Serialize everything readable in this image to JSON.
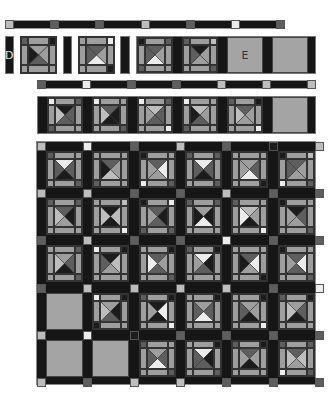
{
  "palette": {
    "w": "#ececec",
    "l": "#bdbdbd",
    "m": "#9e9e9e",
    "d": "#5e5e5e",
    "k": "#1c1c1c"
  },
  "labels": {
    "d": "D",
    "e": "E"
  },
  "top_bar": {
    "nodes": [
      "l",
      "d",
      "d",
      "l",
      "d",
      "w",
      "d"
    ]
  },
  "row2": {
    "tiles": [
      {
        "t": "m",
        "r": "m",
        "b": "d",
        "l": "k",
        "tl": "d",
        "tr": "k",
        "br": "m",
        "bl": "m"
      },
      {
        "t": "d",
        "r": "m",
        "b": "w",
        "l": "d",
        "tl": "m",
        "tr": "w",
        "br": "k",
        "bl": "m"
      },
      {
        "t": "d",
        "r": "m",
        "b": "w",
        "l": "d",
        "tl": "k",
        "tr": "d",
        "br": "m",
        "bl": "d"
      },
      {
        "t": "k",
        "r": "m",
        "b": "m",
        "l": "d",
        "tl": "d",
        "tr": "l",
        "br": "d",
        "bl": "m"
      }
    ]
  },
  "row3_bar": {
    "nodes": [
      "d",
      "w",
      "d",
      "d",
      "l",
      "l",
      "l"
    ]
  },
  "row4": {
    "tiles": [
      {
        "t": "k",
        "r": "d",
        "b": "d",
        "l": "l",
        "tl": "w",
        "tr": "d",
        "br": "m",
        "bl": "d"
      },
      {
        "t": "d",
        "r": "k",
        "b": "k",
        "l": "l",
        "tl": "w",
        "tr": "m",
        "br": "d",
        "bl": "m"
      },
      {
        "t": "l",
        "r": "d",
        "b": "d",
        "l": "m",
        "tl": "w",
        "tr": "d",
        "br": "w",
        "bl": "m"
      },
      {
        "t": "l",
        "r": "m",
        "b": "d",
        "l": "k",
        "tl": "w",
        "tr": "m",
        "br": "m",
        "bl": "d"
      },
      {
        "t": "d",
        "r": "m",
        "b": "m",
        "l": "l",
        "tl": "d",
        "tr": "k",
        "br": "w",
        "bl": "m"
      }
    ]
  },
  "grid": {
    "cols": 6,
    "rows": 5,
    "h_nodes": [
      [
        "l",
        "w",
        "d",
        "l",
        "d",
        "k",
        "l"
      ],
      [
        "l",
        "l",
        "d",
        "d",
        "l",
        "d",
        "d"
      ],
      [
        "d",
        "l",
        "d",
        "d",
        "w",
        "d",
        "d"
      ],
      [
        "d",
        "l",
        "l",
        "l",
        "l",
        "d",
        "w"
      ],
      [
        "l",
        "w",
        "k",
        "d",
        "d",
        "d",
        "d"
      ],
      [
        "l",
        "d",
        "l",
        "l",
        "d",
        "d",
        "d"
      ]
    ],
    "cells": [
      [
        {
          "t": "w",
          "r": "d",
          "b": "k",
          "l": "d",
          "tl": "d",
          "tr": "m",
          "br": "d",
          "bl": "m"
        },
        {
          "t": "d",
          "r": "m",
          "b": "l",
          "l": "k",
          "tl": "m",
          "tr": "m",
          "br": "m",
          "bl": "d"
        },
        {
          "t": "d",
          "r": "w",
          "b": "m",
          "l": "m",
          "tl": "k",
          "tr": "m",
          "br": "d",
          "bl": "w"
        },
        {
          "t": "w",
          "r": "d",
          "b": "k",
          "l": "d",
          "tl": "d",
          "tr": "d",
          "br": "d",
          "bl": "m"
        },
        {
          "t": "m",
          "r": "d",
          "b": "w",
          "l": "m",
          "tl": "m",
          "tr": "m",
          "br": "k",
          "bl": "m"
        },
        {
          "t": "d",
          "r": "m",
          "b": "m",
          "l": "d",
          "tl": "k",
          "tr": "l",
          "br": "d",
          "bl": "w"
        }
      ],
      [
        {
          "t": "d",
          "r": "k",
          "b": "m",
          "l": "l",
          "tl": "d",
          "tr": "d",
          "br": "m",
          "bl": "m"
        },
        {
          "t": "k",
          "r": "l",
          "b": "k",
          "l": "l",
          "tl": "m",
          "tr": "l",
          "br": "w",
          "bl": "m"
        },
        {
          "t": "d",
          "r": "k",
          "b": "d",
          "l": "m",
          "tl": "k",
          "tr": "w",
          "br": "d",
          "bl": "d"
        },
        {
          "t": "m",
          "r": "k",
          "b": "w",
          "l": "k",
          "tl": "d",
          "tr": "d",
          "br": "m",
          "bl": "m"
        },
        {
          "t": "l",
          "r": "m",
          "b": "k",
          "l": "w",
          "tl": "d",
          "tr": "m",
          "br": "w",
          "bl": "m"
        },
        {
          "t": "k",
          "r": "d",
          "b": "m",
          "l": "m",
          "tl": "k",
          "tr": "m",
          "br": "d",
          "bl": "m"
        }
      ],
      [
        {
          "t": "m",
          "r": "d",
          "b": "k",
          "l": "l",
          "tl": "m",
          "tr": "d",
          "br": "d",
          "bl": "m"
        },
        {
          "t": "k",
          "r": "l",
          "b": "m",
          "l": "d",
          "tl": "w",
          "tr": "k",
          "br": "m",
          "bl": "m"
        },
        {
          "t": "d",
          "r": "m",
          "b": "d",
          "l": "w",
          "tl": "m",
          "tr": "k",
          "br": "d",
          "bl": "m"
        },
        {
          "t": "w",
          "r": "k",
          "b": "d",
          "l": "m",
          "tl": "d",
          "tr": "k",
          "br": "m",
          "bl": "m"
        },
        {
          "t": "d",
          "r": "w",
          "b": "m",
          "l": "k",
          "tl": "m",
          "tr": "m",
          "br": "k",
          "bl": "m"
        },
        {
          "t": "d",
          "r": "w",
          "b": "d",
          "l": "m",
          "tl": "k",
          "tr": "m",
          "br": "d",
          "bl": "m"
        }
      ],
      [
        null,
        {
          "t": "m",
          "r": "k",
          "b": "d",
          "l": "l",
          "tl": "w",
          "tr": "k",
          "br": "m",
          "bl": "k"
        },
        {
          "t": "k",
          "r": "w",
          "b": "k",
          "l": "m",
          "tl": "d",
          "tr": "k",
          "br": "w",
          "bl": "m"
        },
        {
          "t": "m",
          "r": "d",
          "b": "w",
          "l": "d",
          "tl": "m",
          "tr": "k",
          "br": "m",
          "bl": "m"
        },
        {
          "t": "m",
          "r": "m",
          "b": "k",
          "l": "d",
          "tl": "m",
          "tr": "k",
          "br": "w",
          "bl": "m"
        },
        {
          "t": "m",
          "r": "d",
          "b": "k",
          "l": "l",
          "tl": "d",
          "tr": "k",
          "br": "m",
          "bl": "m"
        }
      ],
      [
        null,
        null,
        {
          "t": "m",
          "r": "d",
          "b": "w",
          "l": "d",
          "tl": "d",
          "tr": "m",
          "br": "d",
          "bl": "m"
        },
        {
          "t": "w",
          "r": "k",
          "b": "d",
          "l": "d",
          "tl": "m",
          "tr": "k",
          "br": "d",
          "bl": "m"
        },
        {
          "t": "d",
          "r": "m",
          "b": "k",
          "l": "m",
          "tl": "d",
          "tr": "k",
          "br": "m",
          "bl": "m"
        },
        {
          "t": "d",
          "r": "l",
          "b": "m",
          "l": "l",
          "tl": "d",
          "tr": "d",
          "br": "d",
          "bl": "w"
        }
      ]
    ]
  }
}
